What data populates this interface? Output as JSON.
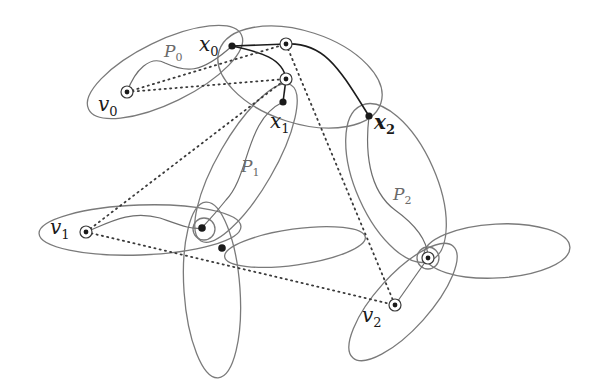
{
  "figure": {
    "vertex_labels": {
      "v0": {
        "base": "v",
        "sub": "0"
      },
      "v1": {
        "base": "v",
        "sub": "1"
      },
      "v2": {
        "base": "v",
        "sub": "2"
      },
      "x0": {
        "base": "x",
        "sub": "0"
      },
      "x1": {
        "base": "x",
        "sub": "1"
      },
      "x2": {
        "base": "x",
        "sub": "2"
      }
    },
    "path_labels": {
      "P0": {
        "base": "P",
        "sub": "0"
      },
      "P1": {
        "base": "P",
        "sub": "1"
      },
      "P2": {
        "base": "P",
        "sub": "2"
      }
    },
    "nodes": [
      {
        "id": "v0",
        "x": 127,
        "y": 92,
        "style": "ringed"
      },
      {
        "id": "x0",
        "x": 232,
        "y": 46,
        "style": "filled"
      },
      {
        "id": "a",
        "x": 286,
        "y": 44,
        "style": "ringed"
      },
      {
        "id": "b",
        "x": 286,
        "y": 79,
        "style": "ringed"
      },
      {
        "id": "x1",
        "x": 283,
        "y": 102,
        "style": "filled"
      },
      {
        "id": "x2",
        "x": 369,
        "y": 116,
        "style": "filled"
      },
      {
        "id": "v1",
        "x": 86,
        "y": 232,
        "style": "ringed"
      },
      {
        "id": "c",
        "x": 202,
        "y": 228,
        "style": "ringed"
      },
      {
        "id": "d",
        "x": 222,
        "y": 248,
        "style": "filled"
      },
      {
        "id": "e",
        "x": 428,
        "y": 258,
        "style": "ringed"
      },
      {
        "id": "v2",
        "x": 395,
        "y": 305,
        "style": "ringed"
      }
    ],
    "colors": {
      "ellipse_stroke": "#7a7a7a",
      "bold_path": "#1c1c1c",
      "dotted": "#3a3a3a",
      "background": "#ffffff"
    }
  }
}
